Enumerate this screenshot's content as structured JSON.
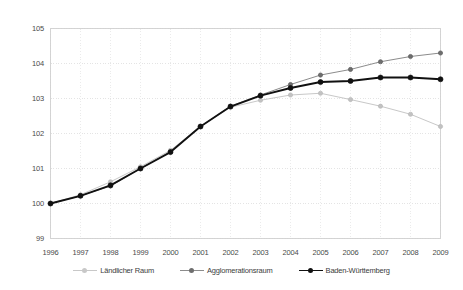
{
  "chart_data": {
    "type": "line",
    "title": "",
    "subtitle": "",
    "xlabel": "",
    "ylabel": "",
    "x": [
      1996,
      1997,
      1998,
      1999,
      2000,
      2001,
      2002,
      2003,
      2004,
      2005,
      2006,
      2007,
      2008,
      2009
    ],
    "categories": [
      "1996",
      "1997",
      "1998",
      "1999",
      "2000",
      "2001",
      "2002",
      "2003",
      "2004",
      "2005",
      "2006",
      "2007",
      "2008",
      "2009"
    ],
    "xlim": [
      1996,
      2009
    ],
    "ylim": [
      99,
      105
    ],
    "yticks": [
      99,
      100,
      101,
      102,
      103,
      104,
      105
    ],
    "ytick_labels": [
      "99",
      "100",
      "101",
      "102",
      "103",
      "104",
      "105"
    ],
    "xtick_labels": [
      "1996",
      "1997",
      "1998",
      "1999",
      "2000",
      "2001",
      "2002",
      "2003",
      "2004",
      "2005",
      "2006",
      "2007",
      "2008",
      "2009"
    ],
    "grid": true,
    "grid_style": "dotted",
    "legend_position": "bottom",
    "series": [
      {
        "name": "Ländlicher Raum",
        "color": "#c8c8c8",
        "marker": "circle",
        "values": [
          100.0,
          100.25,
          100.62,
          101.05,
          101.52,
          102.2,
          102.75,
          102.95,
          103.1,
          103.15,
          102.97,
          102.78,
          102.55,
          102.2
        ]
      },
      {
        "name": "Agglomerationsraum",
        "color": "#8c8c8c",
        "marker": "circle",
        "values": [
          100.0,
          100.22,
          100.5,
          101.0,
          101.47,
          102.2,
          102.78,
          103.1,
          103.4,
          103.67,
          103.83,
          104.05,
          104.2,
          104.3
        ]
      },
      {
        "name": "Baden-Württemberg",
        "color": "#111111",
        "marker": "circle",
        "values": [
          100.0,
          100.22,
          100.52,
          101.0,
          101.47,
          102.2,
          102.77,
          103.08,
          103.3,
          103.47,
          103.5,
          103.6,
          103.6,
          103.55
        ]
      }
    ]
  },
  "legend": {
    "items": [
      {
        "label": "Ländlicher Raum"
      },
      {
        "label": "Agglomerationsraum"
      },
      {
        "label": "Baden-Württemberg"
      }
    ]
  }
}
